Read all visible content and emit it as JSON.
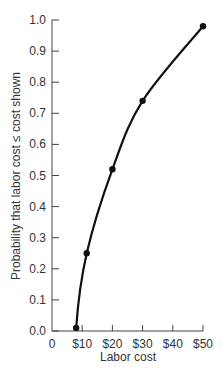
{
  "chart_data": {
    "type": "line",
    "title": "",
    "xlabel": "Labor cost",
    "ylabel": "Probability that labor cost ≤ cost shown",
    "x_tick_labels": [
      "0",
      "$10",
      "$20",
      "$30",
      "$40",
      "$50"
    ],
    "x_ticks": [
      0,
      10,
      20,
      30,
      40,
      50
    ],
    "y_tick_labels": [
      "0.0",
      "0.1",
      "0.2",
      "0.3",
      "0.4",
      "0.5",
      "0.6",
      "0.7",
      "0.8",
      "0.9",
      "1.0"
    ],
    "y_ticks": [
      0.0,
      0.1,
      0.2,
      0.3,
      0.4,
      0.5,
      0.6,
      0.7,
      0.8,
      0.9,
      1.0
    ],
    "xlim": [
      0,
      50
    ],
    "ylim": [
      0,
      1.0
    ],
    "grid": false,
    "legend": "none",
    "series": [
      {
        "name": "Cumulative probability",
        "markers": true,
        "x": [
          8,
          11.5,
          20,
          30,
          50
        ],
        "y": [
          0.01,
          0.25,
          0.52,
          0.74,
          0.98
        ]
      }
    ],
    "curve_color": "#111111",
    "caption": "Figure 10.11"
  }
}
